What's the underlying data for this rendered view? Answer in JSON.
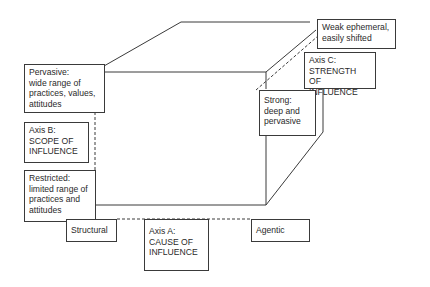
{
  "diagram": {
    "type": "3d-cube-axes",
    "colors": {
      "line": "#3a3a3a",
      "text": "#2a2a2a",
      "background": "#ffffff"
    },
    "axis_a": {
      "label": "Axis A:\nCAUSE OF\nINFLUENCE",
      "low": "Structural",
      "high": "Agentic"
    },
    "axis_b": {
      "label": "Axis B:\nSCOPE OF\nINFLUENCE",
      "high": "Pervasive:\nwide range of\npractices, values,\nattitudes",
      "low": "Restricted:\nlimited range of\npractices and\nattitudes"
    },
    "axis_c": {
      "label": "Axis C:\nSTRENGTH\nOF INFLUENCE",
      "low": "Weak ephemeral,\neasily shifted",
      "high": "Strong:\ndeep and\npervasive"
    }
  }
}
